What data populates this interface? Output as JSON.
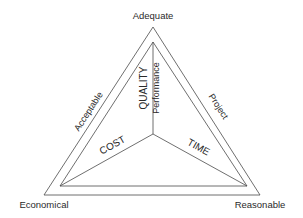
{
  "diagram": {
    "type": "triangle-of-objectives",
    "corners": {
      "top": "Adequate",
      "bottom_left": "Economical",
      "bottom_right": "Reasonable"
    },
    "sides": {
      "left": "Acceptable",
      "right": "Project"
    },
    "axes": {
      "vertical_main": "QUALITY",
      "vertical_sub": "Performance",
      "left": "COST",
      "right": "TIME"
    },
    "colors": {
      "line": "#4a4a4a",
      "text": "#2a2a2a",
      "background": "#ffffff"
    }
  }
}
